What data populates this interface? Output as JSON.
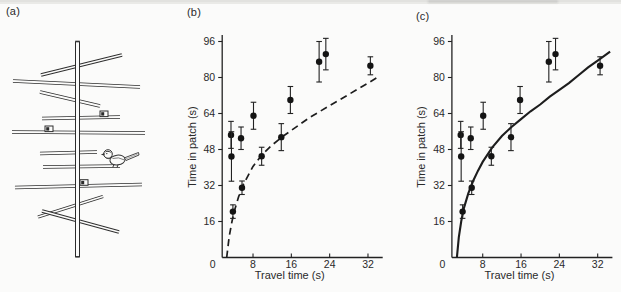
{
  "figure": {
    "background_color": "#fbfbfa",
    "ink_color": "#222222",
    "panels": {
      "a": {
        "label": "(a)",
        "illustration": "artificial-tree-with-feeder-boxes-and-bird"
      },
      "b": {
        "label": "(b)"
      },
      "c": {
        "label": "(c)"
      }
    }
  },
  "chart_data": [
    {
      "panel": "b",
      "type": "scatter",
      "title": "",
      "xlabel": "Travel time (s)",
      "ylabel": "Time in patch (s)",
      "xlim": [
        0,
        36
      ],
      "ylim": [
        0,
        100
      ],
      "x_ticks": [
        0,
        8,
        16,
        24,
        32
      ],
      "y_ticks": [
        16,
        32,
        48,
        64,
        80,
        96
      ],
      "grid": false,
      "legend": "none",
      "curve_style": "dashed",
      "points": [
        {
          "x": 3.4,
          "y": 54.5,
          "err": 6
        },
        {
          "x": 3.5,
          "y": 44.9,
          "err": 11
        },
        {
          "x": 3.8,
          "y": 20.4,
          "err": 3
        },
        {
          "x": 5.5,
          "y": 53.0,
          "err": 5
        },
        {
          "x": 5.7,
          "y": 31.0,
          "err": 3
        },
        {
          "x": 8.1,
          "y": 63.0,
          "err": 6
        },
        {
          "x": 9.8,
          "y": 45.0,
          "err": 4
        },
        {
          "x": 13.9,
          "y": 53.5,
          "err": 6
        },
        {
          "x": 15.8,
          "y": 70.0,
          "err": 6
        },
        {
          "x": 21.8,
          "y": 87.0,
          "err": 9
        },
        {
          "x": 23.2,
          "y": 90.4,
          "err": 7
        },
        {
          "x": 32.5,
          "y": 85.2,
          "err": 4
        }
      ],
      "curve": [
        [
          2.5,
          0
        ],
        [
          3,
          9
        ],
        [
          3.5,
          15
        ],
        [
          4,
          20
        ],
        [
          5,
          27
        ],
        [
          6,
          32.5
        ],
        [
          8,
          40.5
        ],
        [
          10,
          46
        ],
        [
          12,
          50
        ],
        [
          14,
          53.5
        ],
        [
          16,
          56.5
        ],
        [
          18,
          59.5
        ],
        [
          20,
          62.5
        ],
        [
          22,
          65
        ],
        [
          24,
          67.5
        ],
        [
          26,
          70
        ],
        [
          28,
          72.5
        ],
        [
          30,
          75
        ],
        [
          32,
          77.5
        ],
        [
          34.3,
          80.5
        ]
      ]
    },
    {
      "panel": "c",
      "type": "scatter",
      "title": "",
      "xlabel": "Travel time (s)",
      "ylabel": "Time in patch (s)",
      "xlim": [
        0,
        36
      ],
      "ylim": [
        0,
        100
      ],
      "x_ticks": [
        0,
        8,
        16,
        24,
        32
      ],
      "y_ticks": [
        16,
        32,
        48,
        64,
        80,
        96
      ],
      "grid": false,
      "legend": "none",
      "curve_style": "solid",
      "points": [
        {
          "x": 3.4,
          "y": 54.5,
          "err": 6
        },
        {
          "x": 3.5,
          "y": 44.9,
          "err": 11
        },
        {
          "x": 3.8,
          "y": 20.4,
          "err": 3
        },
        {
          "x": 5.5,
          "y": 53.0,
          "err": 5
        },
        {
          "x": 5.7,
          "y": 31.0,
          "err": 3
        },
        {
          "x": 8.1,
          "y": 63.0,
          "err": 6
        },
        {
          "x": 9.8,
          "y": 45.0,
          "err": 4
        },
        {
          "x": 13.9,
          "y": 53.5,
          "err": 6
        },
        {
          "x": 15.8,
          "y": 70.0,
          "err": 6
        },
        {
          "x": 21.8,
          "y": 87.0,
          "err": 9
        },
        {
          "x": 23.2,
          "y": 90.4,
          "err": 7
        },
        {
          "x": 32.5,
          "y": 85.2,
          "err": 4
        }
      ],
      "curve": [
        [
          2.6,
          0
        ],
        [
          3,
          9
        ],
        [
          3.5,
          16
        ],
        [
          4,
          21.5
        ],
        [
          5,
          28.5
        ],
        [
          6,
          34
        ],
        [
          7,
          38.5
        ],
        [
          8,
          42.5
        ],
        [
          10,
          49
        ],
        [
          12,
          54
        ],
        [
          14,
          58
        ],
        [
          16,
          61.5
        ],
        [
          18,
          65
        ],
        [
          20,
          68
        ],
        [
          22,
          71.5
        ],
        [
          24,
          74.5
        ],
        [
          26,
          77.5
        ],
        [
          28,
          81
        ],
        [
          30,
          84.5
        ],
        [
          32,
          87.5
        ],
        [
          34.6,
          91.5
        ]
      ]
    }
  ]
}
